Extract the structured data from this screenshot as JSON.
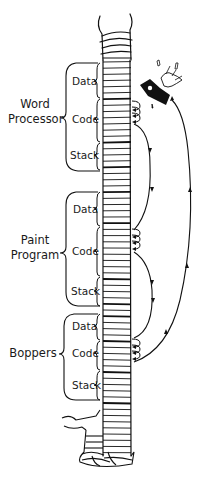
{
  "programs": [
    {
      "name_line1": "Word",
      "name_line2": "Processor",
      "segments": [
        "Data",
        "Code",
        "Stack"
      ]
    },
    {
      "name_line1": "Paint",
      "name_line2": "Program",
      "segments": [
        "Data",
        "Code",
        "Stack"
      ]
    },
    {
      "name_line1": "Boppers",
      "name_line2": "",
      "segments": [
        "Data",
        "Code",
        "Stack"
      ]
    }
  ],
  "icons": {
    "crash": "flying-toaster-icon"
  },
  "colors": {
    "ink": "#111111",
    "background": "#ffffff"
  }
}
